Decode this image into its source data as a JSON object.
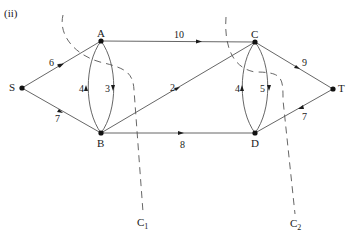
{
  "figure": {
    "title": "(ii)",
    "nodes": [
      {
        "id": "S",
        "label": "S"
      },
      {
        "id": "A",
        "label": "A"
      },
      {
        "id": "B",
        "label": "B"
      },
      {
        "id": "C",
        "label": "C"
      },
      {
        "id": "D",
        "label": "D"
      },
      {
        "id": "T",
        "label": "T"
      }
    ],
    "edges": [
      {
        "from": "S",
        "to": "A",
        "capacity": "6"
      },
      {
        "from": "S",
        "to": "B",
        "capacity": "7"
      },
      {
        "from": "A",
        "to": "C",
        "capacity": "10"
      },
      {
        "from": "B",
        "to": "A",
        "capacity": "4"
      },
      {
        "from": "A",
        "to": "B",
        "capacity": "3"
      },
      {
        "from": "B",
        "to": "C",
        "capacity": "2"
      },
      {
        "from": "B",
        "to": "D",
        "capacity": "8"
      },
      {
        "from": "D",
        "to": "C",
        "capacity": "4"
      },
      {
        "from": "C",
        "to": "D",
        "capacity": "5"
      },
      {
        "from": "C",
        "to": "T",
        "capacity": "9"
      },
      {
        "from": "D",
        "to": "T",
        "capacity": "7"
      }
    ],
    "cuts": [
      {
        "name": "C",
        "subscript": "1"
      },
      {
        "name": "C",
        "subscript": "2"
      }
    ]
  }
}
